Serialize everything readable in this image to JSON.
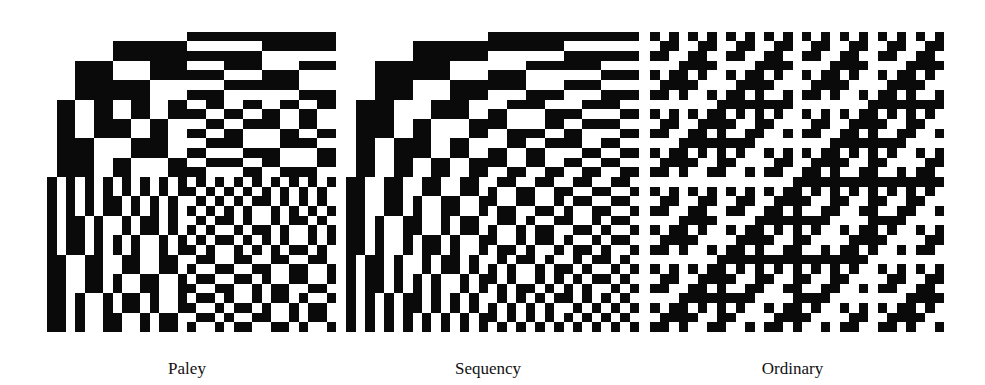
{
  "figure": {
    "size": 32,
    "colors": {
      "negative": "#0a0a0a",
      "positive": "#ffffff"
    },
    "panels": [
      {
        "label": "Paley",
        "ordering": "paley",
        "x": 38,
        "width": 298
      },
      {
        "label": "Sequency",
        "ordering": "sequency",
        "x": 337,
        "width": 302
      },
      {
        "label": "Ordinary",
        "ordering": "ordinary",
        "x": 641,
        "width": 303
      }
    ]
  }
}
